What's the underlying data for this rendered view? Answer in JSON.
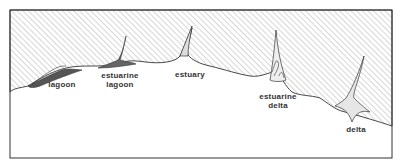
{
  "diagram": {
    "type": "coastline-landform-sketch",
    "colors": {
      "land_hatch": "#9a9a9a",
      "outline": "#333333",
      "sea": "#ffffff"
    },
    "labels": [
      {
        "id": "lagoon",
        "text": "lagoon"
      },
      {
        "id": "estuarine-lagoon",
        "line1": "estuarine",
        "line2": "lagoon"
      },
      {
        "id": "estuary",
        "text": "estuary"
      },
      {
        "id": "estuarine-delta",
        "line1": "estuarine",
        "line2": "delta"
      },
      {
        "id": "delta",
        "text": "delta"
      }
    ]
  }
}
